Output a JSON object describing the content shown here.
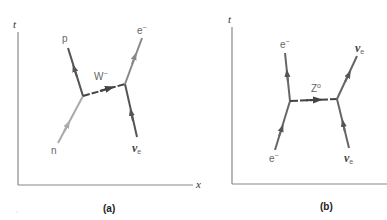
{
  "panels": [
    {
      "id": "a",
      "caption": "(a)",
      "axes": {
        "y_label": "t",
        "x_label": "x"
      },
      "boson": {
        "label": "W",
        "charge": "−"
      },
      "particles": {
        "in_left": {
          "label": "n"
        },
        "out_left": {
          "label": "p"
        },
        "in_right": {
          "label": "ν",
          "sub": "e"
        },
        "out_right": {
          "label": "e",
          "charge": "−"
        }
      }
    },
    {
      "id": "b",
      "caption": "(b)",
      "axes": {
        "y_label": "t"
      },
      "boson": {
        "label": "Z",
        "charge": "o"
      },
      "particles": {
        "in_left": {
          "label": "e",
          "charge": "−"
        },
        "out_left": {
          "label": "e",
          "charge": "−"
        },
        "in_right": {
          "label": "ν",
          "sub": "e"
        },
        "out_right": {
          "label": "ν",
          "sub": "e"
        }
      }
    }
  ],
  "colors": {
    "axis": "#888888",
    "dark_line": "#555555",
    "light_line": "#aaaaaa",
    "mid_line": "#888888",
    "boson_line": "#444444"
  }
}
